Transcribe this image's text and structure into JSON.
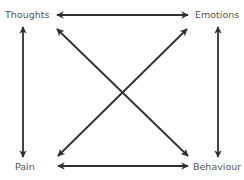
{
  "diagram": {
    "type": "relationship-cycle",
    "nodes": [
      {
        "id": "thoughts",
        "label": "Thoughts",
        "position": "top-left"
      },
      {
        "id": "emotions",
        "label": "Emotions",
        "position": "top-right"
      },
      {
        "id": "pain",
        "label": "Pain",
        "position": "bottom-left"
      },
      {
        "id": "behaviour",
        "label": "Behaviour",
        "position": "bottom-right"
      }
    ],
    "edges": [
      {
        "from": "thoughts",
        "to": "emotions",
        "direction": "bidirectional"
      },
      {
        "from": "pain",
        "to": "behaviour",
        "direction": "bidirectional"
      },
      {
        "from": "thoughts",
        "to": "pain",
        "direction": "bidirectional"
      },
      {
        "from": "emotions",
        "to": "behaviour",
        "direction": "bidirectional"
      },
      {
        "from": "thoughts",
        "to": "behaviour",
        "direction": "bidirectional"
      },
      {
        "from": "emotions",
        "to": "pain",
        "direction": "bidirectional"
      }
    ],
    "colors": {
      "arrow": "#2f2f2f",
      "label": "#555555",
      "background": "#ffffff"
    }
  }
}
